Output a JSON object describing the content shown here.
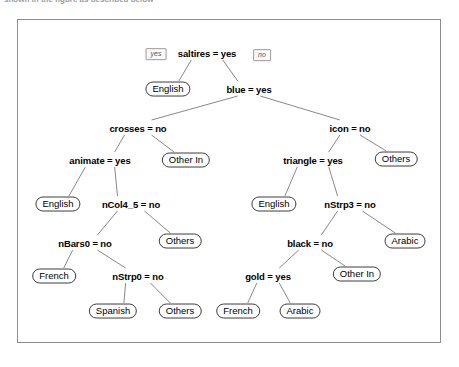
{
  "caption": {
    "text": "shown in the figure as described below"
  },
  "figure": {
    "edge_labels": [
      {
        "name": "yes-branch-label",
        "text": "yes",
        "x": 156,
        "y": 54
      },
      {
        "name": "no-branch-label",
        "text": "no",
        "x": 262,
        "y": 55
      }
    ],
    "nodes": [
      {
        "id": "n0",
        "kind": "split",
        "label": "saltires = yes",
        "x": 207,
        "y": 53
      },
      {
        "id": "n1",
        "kind": "leaf",
        "label": "English",
        "x": 168,
        "y": 89
      },
      {
        "id": "n2",
        "kind": "split",
        "label": "blue = yes",
        "x": 249,
        "y": 89
      },
      {
        "id": "n3",
        "kind": "split",
        "label": "crosses = no",
        "x": 138,
        "y": 128
      },
      {
        "id": "n4",
        "kind": "split",
        "label": "icon = no",
        "x": 350,
        "y": 128
      },
      {
        "id": "n5",
        "kind": "split",
        "label": "animate = yes",
        "x": 100,
        "y": 160
      },
      {
        "id": "n6",
        "kind": "leaf",
        "label": "Other In",
        "x": 186,
        "y": 160
      },
      {
        "id": "n7",
        "kind": "split",
        "label": "triangle = yes",
        "x": 313,
        "y": 160
      },
      {
        "id": "n8",
        "kind": "leaf",
        "label": "Others",
        "x": 396,
        "y": 159
      },
      {
        "id": "n9",
        "kind": "leaf",
        "label": "English",
        "x": 58,
        "y": 204
      },
      {
        "id": "n10",
        "kind": "split",
        "label": "nCol4_5 = no",
        "x": 131,
        "y": 204
      },
      {
        "id": "n11",
        "kind": "leaf",
        "label": "English",
        "x": 274,
        "y": 204
      },
      {
        "id": "n12",
        "kind": "split",
        "label": "nStrp3 = no",
        "x": 350,
        "y": 204
      },
      {
        "id": "n13",
        "kind": "split",
        "label": "nBars0 = no",
        "x": 85,
        "y": 243
      },
      {
        "id": "n14",
        "kind": "leaf",
        "label": "Others",
        "x": 180,
        "y": 241
      },
      {
        "id": "n15",
        "kind": "split",
        "label": "black = no",
        "x": 310,
        "y": 243
      },
      {
        "id": "n16",
        "kind": "leaf",
        "label": "Arabic",
        "x": 405,
        "y": 241
      },
      {
        "id": "n17",
        "kind": "leaf",
        "label": "French",
        "x": 54,
        "y": 276
      },
      {
        "id": "n18",
        "kind": "split",
        "label": "nStrp0 = no",
        "x": 138,
        "y": 276
      },
      {
        "id": "n19",
        "kind": "split",
        "label": "gold = yes",
        "x": 268,
        "y": 276
      },
      {
        "id": "n20",
        "kind": "leaf",
        "label": "Other In",
        "x": 357,
        "y": 274
      },
      {
        "id": "n21",
        "kind": "leaf",
        "label": "Spanish",
        "x": 113,
        "y": 311
      },
      {
        "id": "n22",
        "kind": "leaf",
        "label": "Others",
        "x": 180,
        "y": 311
      },
      {
        "id": "n23",
        "kind": "leaf",
        "label": "French",
        "x": 238,
        "y": 311
      },
      {
        "id": "n24",
        "kind": "leaf",
        "label": "Arabic",
        "x": 300,
        "y": 311
      }
    ],
    "edges": [
      {
        "from": "n0",
        "to": "n1"
      },
      {
        "from": "n0",
        "to": "n2"
      },
      {
        "from": "n2",
        "to": "n3"
      },
      {
        "from": "n2",
        "to": "n4"
      },
      {
        "from": "n3",
        "to": "n5"
      },
      {
        "from": "n3",
        "to": "n6"
      },
      {
        "from": "n4",
        "to": "n7"
      },
      {
        "from": "n4",
        "to": "n8"
      },
      {
        "from": "n5",
        "to": "n9"
      },
      {
        "from": "n5",
        "to": "n10"
      },
      {
        "from": "n7",
        "to": "n11"
      },
      {
        "from": "n7",
        "to": "n12"
      },
      {
        "from": "n10",
        "to": "n13"
      },
      {
        "from": "n10",
        "to": "n14"
      },
      {
        "from": "n12",
        "to": "n15"
      },
      {
        "from": "n12",
        "to": "n16"
      },
      {
        "from": "n13",
        "to": "n17"
      },
      {
        "from": "n13",
        "to": "n18"
      },
      {
        "from": "n15",
        "to": "n19"
      },
      {
        "from": "n15",
        "to": "n20"
      },
      {
        "from": "n18",
        "to": "n21"
      },
      {
        "from": "n18",
        "to": "n22"
      },
      {
        "from": "n19",
        "to": "n23"
      },
      {
        "from": "n19",
        "to": "n24"
      }
    ],
    "colors": {
      "frame_border": "#8d8d8d",
      "edge_line": "#7a7a7a",
      "leaf_border": "#3c3c3c",
      "text": "#000000",
      "background": "#ffffff"
    }
  }
}
